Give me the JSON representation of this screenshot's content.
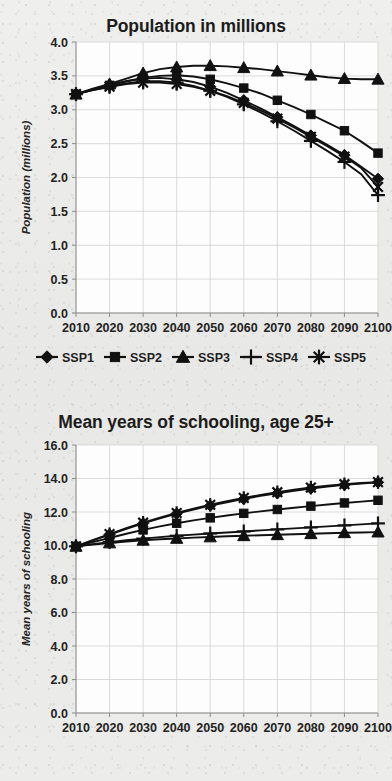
{
  "figure": {
    "background_color": "#ececea",
    "ink_color": "#111111"
  },
  "legend": {
    "position": "below-population-chart",
    "entries": [
      {
        "label": "SSP1",
        "marker": "diamond"
      },
      {
        "label": "SSP2",
        "marker": "square"
      },
      {
        "label": "SSP3",
        "marker": "triangle"
      },
      {
        "label": "SSP4",
        "marker": "plus"
      },
      {
        "label": "SSP5",
        "marker": "asterisk"
      }
    ]
  },
  "chart_data": [
    {
      "id": "population",
      "type": "line",
      "title": "Population in millions",
      "xlabel": "",
      "ylabel": "Population (millions)",
      "x": [
        2010,
        2015,
        2020,
        2025,
        2030,
        2035,
        2040,
        2045,
        2050,
        2055,
        2060,
        2065,
        2070,
        2075,
        2080,
        2085,
        2090,
        2095,
        2100
      ],
      "xticks": [
        "2010",
        "2020",
        "2030",
        "2040",
        "2050",
        "2060",
        "2070",
        "2080",
        "2090",
        "2100"
      ],
      "yticks": [
        "0.0",
        "0.5",
        "1.0",
        "1.5",
        "2.0",
        "2.5",
        "3.0",
        "3.5",
        "4.0"
      ],
      "ylim": [
        0.0,
        4.0
      ],
      "xlim": [
        2010,
        2100
      ],
      "grid": true,
      "series": [
        {
          "name": "SSP1",
          "marker": "diamond",
          "values": [
            3.23,
            3.3,
            3.36,
            3.42,
            3.46,
            3.47,
            3.45,
            3.41,
            3.34,
            3.25,
            3.14,
            3.02,
            2.89,
            2.76,
            2.62,
            2.48,
            2.33,
            2.16,
            1.98
          ]
        },
        {
          "name": "SSP2",
          "marker": "square",
          "values": [
            3.23,
            3.3,
            3.36,
            3.42,
            3.47,
            3.5,
            3.51,
            3.49,
            3.45,
            3.39,
            3.32,
            3.24,
            3.14,
            3.04,
            2.93,
            2.81,
            2.69,
            2.53,
            2.36
          ]
        },
        {
          "name": "SSP3",
          "marker": "triangle",
          "values": [
            3.23,
            3.31,
            3.38,
            3.46,
            3.54,
            3.6,
            3.63,
            3.65,
            3.65,
            3.64,
            3.62,
            3.6,
            3.57,
            3.54,
            3.51,
            3.48,
            3.46,
            3.45,
            3.45
          ]
        },
        {
          "name": "SSP4",
          "marker": "plus",
          "values": [
            3.23,
            3.29,
            3.34,
            3.39,
            3.42,
            3.42,
            3.4,
            3.35,
            3.28,
            3.19,
            3.08,
            2.96,
            2.83,
            2.69,
            2.54,
            2.39,
            2.23,
            2.05,
            1.74
          ]
        },
        {
          "name": "SSP5",
          "marker": "asterisk",
          "values": [
            3.23,
            3.29,
            3.34,
            3.38,
            3.4,
            3.4,
            3.38,
            3.34,
            3.28,
            3.2,
            3.1,
            2.99,
            2.87,
            2.74,
            2.6,
            2.46,
            2.31,
            2.14,
            1.86
          ]
        }
      ]
    },
    {
      "id": "schooling",
      "type": "line",
      "title": "Mean years of schooling, age 25+",
      "xlabel": "",
      "ylabel": "Mean years of schooling",
      "x": [
        2010,
        2015,
        2020,
        2025,
        2030,
        2035,
        2040,
        2045,
        2050,
        2055,
        2060,
        2065,
        2070,
        2075,
        2080,
        2085,
        2090,
        2095,
        2100
      ],
      "xticks": [
        "2010",
        "2020",
        "2030",
        "2040",
        "2050",
        "2060",
        "2070",
        "2080",
        "2090",
        "2100"
      ],
      "yticks": [
        "0.0",
        "2.0",
        "4.0",
        "6.0",
        "8.0",
        "10.0",
        "12.0",
        "14.0",
        "16.0"
      ],
      "ylim": [
        0.0,
        16.0
      ],
      "xlim": [
        2010,
        2100
      ],
      "grid": true,
      "series": [
        {
          "name": "SSP1",
          "marker": "diamond",
          "values": [
            9.95,
            10.3,
            10.65,
            11.0,
            11.32,
            11.62,
            11.9,
            12.15,
            12.38,
            12.58,
            12.78,
            12.96,
            13.12,
            13.26,
            13.4,
            13.52,
            13.62,
            13.7,
            13.77
          ]
        },
        {
          "name": "SSP2",
          "marker": "square",
          "values": [
            9.95,
            10.2,
            10.45,
            10.7,
            10.93,
            11.14,
            11.33,
            11.5,
            11.65,
            11.79,
            11.92,
            12.04,
            12.15,
            12.25,
            12.35,
            12.45,
            12.54,
            12.62,
            12.7
          ]
        },
        {
          "name": "SSP3",
          "marker": "triangle",
          "values": [
            9.95,
            10.05,
            10.15,
            10.24,
            10.31,
            10.37,
            10.42,
            10.47,
            10.51,
            10.55,
            10.58,
            10.61,
            10.64,
            10.67,
            10.7,
            10.73,
            10.76,
            10.78,
            10.8
          ]
        },
        {
          "name": "SSP4",
          "marker": "plus",
          "values": [
            9.95,
            10.08,
            10.2,
            10.31,
            10.41,
            10.5,
            10.58,
            10.65,
            10.72,
            10.78,
            10.84,
            10.9,
            10.96,
            11.02,
            11.08,
            11.14,
            11.2,
            11.26,
            11.32
          ]
        },
        {
          "name": "SSP5",
          "marker": "asterisk",
          "values": [
            9.95,
            10.32,
            10.68,
            11.03,
            11.36,
            11.66,
            11.94,
            12.2,
            12.43,
            12.64,
            12.84,
            13.02,
            13.18,
            13.33,
            13.46,
            13.57,
            13.66,
            13.73,
            13.78
          ]
        }
      ]
    }
  ]
}
